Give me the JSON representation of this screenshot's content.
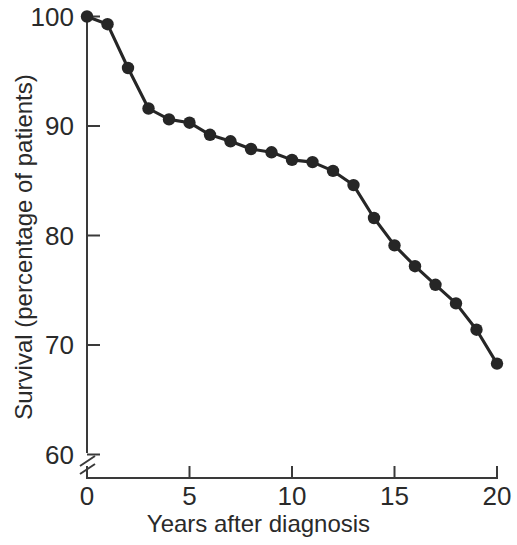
{
  "chart_data": {
    "type": "line",
    "title": "",
    "subtitle": "",
    "xlabel": "Years after diagnosis",
    "ylabel": "Survival (percentage of patients)",
    "x": [
      0,
      1,
      2,
      3,
      4,
      5,
      6,
      7,
      8,
      9,
      10,
      11,
      12,
      13,
      14,
      15,
      16,
      17,
      18,
      19,
      20
    ],
    "values": [
      100.0,
      99.3,
      95.3,
      91.6,
      90.6,
      90.3,
      89.2,
      88.6,
      87.9,
      87.6,
      86.9,
      86.7,
      85.9,
      84.6,
      81.6,
      79.1,
      77.2,
      75.5,
      73.8,
      71.4,
      68.3
    ],
    "series": [
      {
        "name": "Survival",
        "values": [
          100.0,
          99.3,
          95.3,
          91.6,
          90.6,
          90.3,
          89.2,
          88.6,
          87.9,
          87.6,
          86.9,
          86.7,
          85.9,
          84.6,
          81.6,
          79.1,
          77.2,
          75.5,
          73.8,
          71.4,
          68.3
        ]
      }
    ],
    "xlim": [
      0,
      20
    ],
    "ylim": [
      60,
      100
    ],
    "xticks": [
      0,
      5,
      10,
      15,
      20
    ],
    "xtick_labels": [
      "0",
      "5",
      "10",
      "15",
      "20"
    ],
    "yticks": [
      60,
      70,
      80,
      90,
      100
    ],
    "ytick_labels": [
      "60",
      "70",
      "80",
      "90",
      "100"
    ],
    "grid": false,
    "legend": "none",
    "axis_break": {
      "axis": "y",
      "below_value": 60,
      "symbol": "double-slash"
    },
    "marker": "filled-circle",
    "marker_color": "#262626",
    "line_color": "#262626",
    "background_color": "#ffffff",
    "annotations": []
  },
  "axes": {
    "y_title": "Survival (percentage of patients)",
    "x_title": "Years after diagnosis"
  }
}
